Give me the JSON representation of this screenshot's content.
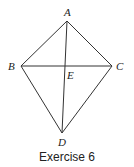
{
  "figure": {
    "caption": "Exercise 6",
    "points": {
      "A": {
        "label": "A",
        "x": 67,
        "y": 21
      },
      "B": {
        "label": "B",
        "x": 21,
        "y": 66
      },
      "C": {
        "label": "C",
        "x": 112,
        "y": 66
      },
      "D": {
        "label": "D",
        "x": 62,
        "y": 133
      },
      "E": {
        "label": "E",
        "x": 66,
        "y": 66
      }
    },
    "segments": [
      "AB",
      "AC",
      "BD",
      "CD",
      "BC",
      "AD"
    ],
    "stroke_color": "#333333"
  }
}
